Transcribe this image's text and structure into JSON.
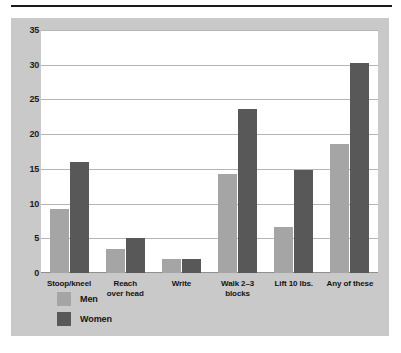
{
  "chart_data": {
    "type": "bar",
    "title": "",
    "subtitle": "",
    "xlabel": "",
    "ylabel": "",
    "ylim": [
      0,
      35
    ],
    "yticks": [
      0,
      5,
      10,
      15,
      20,
      25,
      30,
      35
    ],
    "ytick_labels": [
      "0",
      "5",
      "10",
      "15",
      "20",
      "25",
      "30",
      "35"
    ],
    "grid": true,
    "legend_position": "bottom-left",
    "categories": [
      "Stoop/kneel",
      "Reach over head",
      "Write",
      "Walk 2–3 blocks",
      "Lift 10 lbs.",
      "Any of these"
    ],
    "category_lines": [
      [
        "Stoop/kneel"
      ],
      [
        "Reach",
        "over head"
      ],
      [
        "Write"
      ],
      [
        "Walk 2–3",
        "blocks"
      ],
      [
        "Lift 10 lbs."
      ],
      [
        "Any of these"
      ]
    ],
    "series": [
      {
        "name": "Men",
        "color": "#a5a5a5",
        "values": [
          9.2,
          3.4,
          2.0,
          14.2,
          6.6,
          18.6
        ]
      },
      {
        "name": "Women",
        "color": "#585858",
        "values": [
          16.0,
          5.0,
          2.0,
          23.6,
          14.8,
          30.3
        ]
      }
    ]
  },
  "legend": {
    "items": [
      {
        "label": "Men",
        "color": "#a5a5a5"
      },
      {
        "label": "Women",
        "color": "#585858"
      }
    ]
  },
  "colors": {
    "panel_background": "#c9c9c9",
    "plot_background": "#ffffff",
    "gridline": "#b5b5b5",
    "rule": "#1a1a1a",
    "text": "#141414"
  }
}
